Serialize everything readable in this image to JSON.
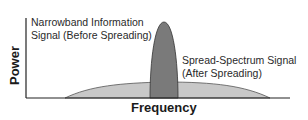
{
  "diagram": {
    "title": "",
    "axes": {
      "y_label": "Power",
      "x_label": "Frequency"
    },
    "signals": [
      {
        "name": "narrowband",
        "label_line1": "Narrowband Information",
        "label_line2": "Signal (Before Spreading)",
        "fill": "#7a7a7a",
        "stroke": "#333333"
      },
      {
        "name": "spread-spectrum",
        "label_line1": "Spread-Spectrum Signal",
        "label_line2": "(After Spreading)",
        "fill": "#c8c8c8",
        "stroke": "#555555"
      }
    ],
    "colors": {
      "axis": "#222222",
      "background": "#ffffff",
      "text": "#2a2a2a"
    }
  }
}
